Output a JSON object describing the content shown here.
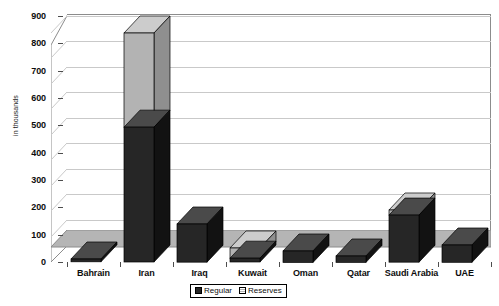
{
  "chart_data": {
    "type": "bar",
    "subtype": "stacked-3d-column",
    "title": "",
    "xlabel": "",
    "ylabel": "in thousands",
    "ylim": [
      0,
      900
    ],
    "ytick_step": 100,
    "yticks": [
      "0",
      "100",
      "200",
      "300",
      "400",
      "500",
      "600",
      "700",
      "800",
      "900"
    ],
    "grid": true,
    "legend_position": "bottom-center",
    "categories": [
      "Bahrain",
      "Iran",
      "Iraq",
      "Kuwait",
      "Oman",
      "Qatar",
      "Saudi Arabia",
      "UAE"
    ],
    "series": [
      {
        "name": "Regular",
        "color": "#262626",
        "values": [
          11,
          530,
          150,
          15,
          45,
          25,
          185,
          68
        ]
      },
      {
        "name": "Reserves",
        "color": "#b3b3b3",
        "values": [
          0,
          370,
          0,
          40,
          0,
          0,
          20,
          0
        ]
      }
    ],
    "totals": [
      11,
      900,
      150,
      55,
      45,
      25,
      205,
      68
    ]
  },
  "legend": {
    "items": [
      {
        "label": "Regular",
        "icon": "legend-swatch-regular"
      },
      {
        "label": "Reserves",
        "icon": "legend-swatch-reserves"
      }
    ]
  },
  "colors": {
    "regular_front": "#262626",
    "regular_top": "#4a4a4a",
    "regular_side": "#121212",
    "reserves_front": "#b3b3b3",
    "reserves_top": "#cccccc",
    "reserves_side": "#8f8f8f",
    "floor": "#b5b5b5",
    "gridline": "#c9c9c9",
    "axis": "#4d4d4d",
    "background": "#ffffff"
  }
}
